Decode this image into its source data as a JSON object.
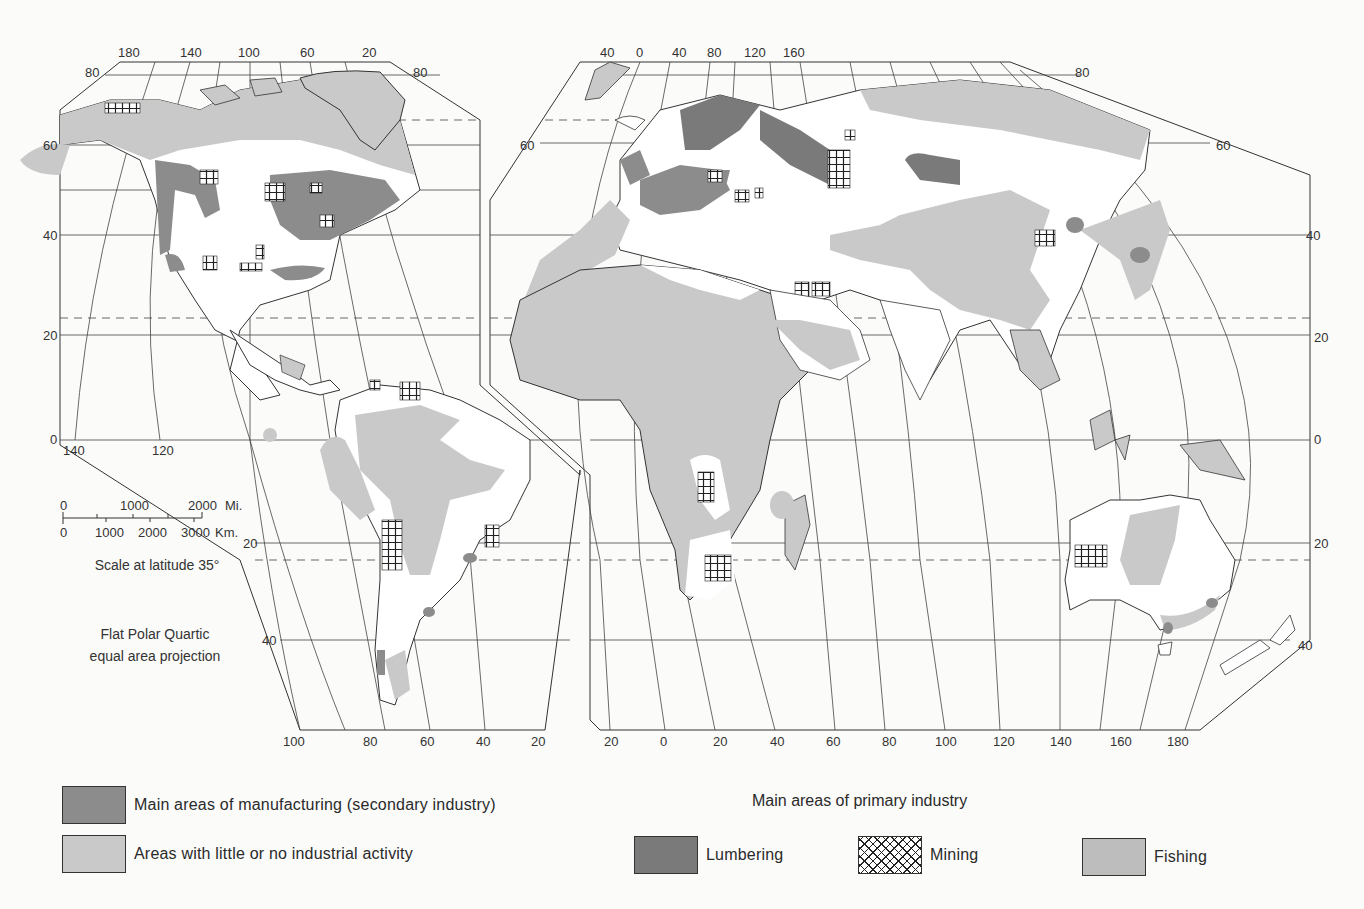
{
  "map": {
    "projection_note_line1": "Flat Polar Quartic",
    "projection_note_line2": "equal area projection",
    "scale": {
      "miles_label": "Mi.",
      "km_label": "Km.",
      "miles_ticks": [
        "0",
        "1000",
        "2000"
      ],
      "km_ticks": [
        "0",
        "1000",
        "2000",
        "3000"
      ],
      "caption": "Scale at latitude 35°"
    },
    "west_panel": {
      "top_longitudes": [
        "180",
        "140",
        "100",
        "60",
        "20"
      ],
      "bottom_longitudes": [
        "100",
        "80",
        "60",
        "40",
        "20"
      ],
      "equator_longitudes": [
        "140",
        "120"
      ],
      "left_latitudes": [
        "80",
        "60",
        "40",
        "20",
        "0"
      ],
      "right_latitude_top": "80",
      "south_latitudes": [
        "20",
        "40"
      ]
    },
    "east_panel": {
      "top_longitudes": [
        "40",
        "0",
        "40",
        "80",
        "120",
        "160"
      ],
      "bottom_longitudes": [
        "20",
        "0",
        "20",
        "40",
        "60",
        "80",
        "100",
        "120",
        "140",
        "160",
        "180"
      ],
      "left_latitudes": [
        "60"
      ],
      "right_latitudes": [
        "80",
        "60",
        "40",
        "20",
        "0",
        "20",
        "40"
      ]
    },
    "colors": {
      "manufacturing": "#8c8c8c",
      "little_activity": "#c9c9c9",
      "lumbering": "#7a7a7a",
      "fishing": "#bdbdbd",
      "line": "#333333",
      "background": "#fbfbfa"
    }
  },
  "legend": {
    "secondary": [
      {
        "key": "manufacturing",
        "label": "Main areas of manufacturing (secondary industry)"
      },
      {
        "key": "little",
        "label": "Areas with little or no industrial activity"
      }
    ],
    "primary_heading": "Main areas of primary industry",
    "primary": [
      {
        "key": "lumbering",
        "label": "Lumbering"
      },
      {
        "key": "mining",
        "label": "Mining"
      },
      {
        "key": "fishing",
        "label": "Fishing"
      }
    ]
  }
}
